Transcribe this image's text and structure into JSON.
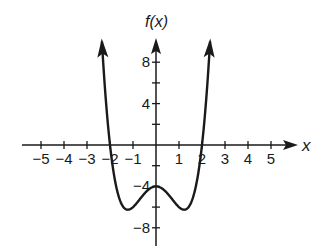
{
  "chart_data": {
    "type": "line",
    "title": "",
    "xlabel": "x",
    "ylabel": "f(x)",
    "xlim": [
      -5.5,
      6
    ],
    "ylim": [
      -9.5,
      10.5
    ],
    "x_ticks": [
      -5,
      -4,
      -3,
      -2,
      -1,
      1,
      2,
      3,
      4,
      5
    ],
    "y_ticks_labeled": [
      8,
      4,
      -4,
      -8
    ],
    "y_ticks": [
      8,
      6,
      4,
      2,
      -2,
      -4,
      -6,
      -8
    ],
    "grid": false,
    "series": [
      {
        "name": "f(x)",
        "description": "quartic with x-intercepts at -2 and 2, y-intercept -4, local minima about -6.25 near x=±1.2, arrows at both ends pointing up",
        "x": [
          -2.25,
          -2,
          -1.5,
          -1.22,
          -1,
          -0.5,
          0,
          0.5,
          1,
          1.22,
          1.5,
          2,
          2.25
        ],
        "y": [
          10,
          0,
          -5.7,
          -6.25,
          -6,
          -4.7,
          -4,
          -4.7,
          -6,
          -6.25,
          -5.7,
          0,
          10
        ]
      }
    ]
  },
  "axes": {
    "x_label": "x",
    "y_label": "f(x)"
  }
}
